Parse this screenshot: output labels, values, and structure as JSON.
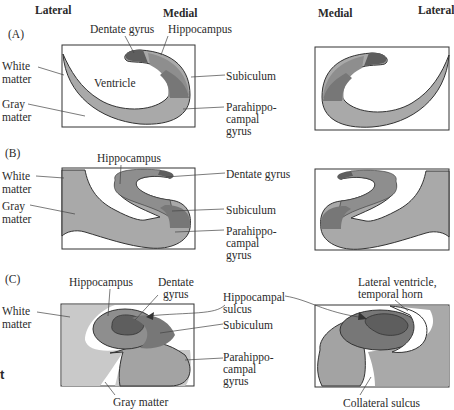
{
  "headers": {
    "left_lateral": "Lateral",
    "left_medial": "Medial",
    "right_medial": "Medial",
    "right_lateral": "Lateral"
  },
  "panels": [
    {
      "id": "A",
      "label": "(A)",
      "labels": {
        "dentate_gyrus": "Dentate gyrus",
        "hippocampus": "Hippocampus",
        "white_matter_1": "White",
        "white_matter_2": "matter",
        "ventricle": "Ventricle",
        "subiculum": "Subiculum",
        "gray_matter_1": "Gray",
        "gray_matter_2": "matter",
        "parahippo_1": "Parahippo-",
        "parahippo_2": "campal",
        "parahippo_3": "gyrus"
      }
    },
    {
      "id": "B",
      "label": "(B)",
      "labels": {
        "hippocampus": "Hippocampus",
        "white_matter_1": "White",
        "white_matter_2": "matter",
        "dentate_gyrus": "Dentate gyrus",
        "gray_matter_1": "Gray",
        "gray_matter_2": "matter",
        "subiculum": "Subiculum",
        "parahippo_1": "Parahippo-",
        "parahippo_2": "campal",
        "parahippo_3": "gyrus"
      }
    },
    {
      "id": "C",
      "label": "(C)",
      "labels": {
        "hippocampus": "Hippocampus",
        "dentate_1": "Dentate",
        "dentate_2": "gyrus",
        "white_matter_1": "White",
        "white_matter_2": "matter",
        "hippo_sulcus_1": "Hippocampal",
        "hippo_sulcus_2": "sulcus",
        "subiculum": "Subiculum",
        "parahippo_1": "Parahippo-",
        "parahippo_2": "campal",
        "parahippo_3": "gyrus",
        "gray_matter": "Gray matter",
        "lat_ventricle_1": "Lateral ventricle,",
        "lat_ventricle_2": "temporal horn",
        "collateral_sulcus": "Collateral sulcus"
      }
    }
  ],
  "fragment_text": "t",
  "colors": {
    "white_matter": "#c9c9c9",
    "gray_matter": "#a9a9a9",
    "parahippocampal": "#a3a3a3",
    "subiculum": "#777777",
    "hippocampus": "#8e8e8e",
    "dentate": "#5e5e5e",
    "outline": "#333333"
  }
}
